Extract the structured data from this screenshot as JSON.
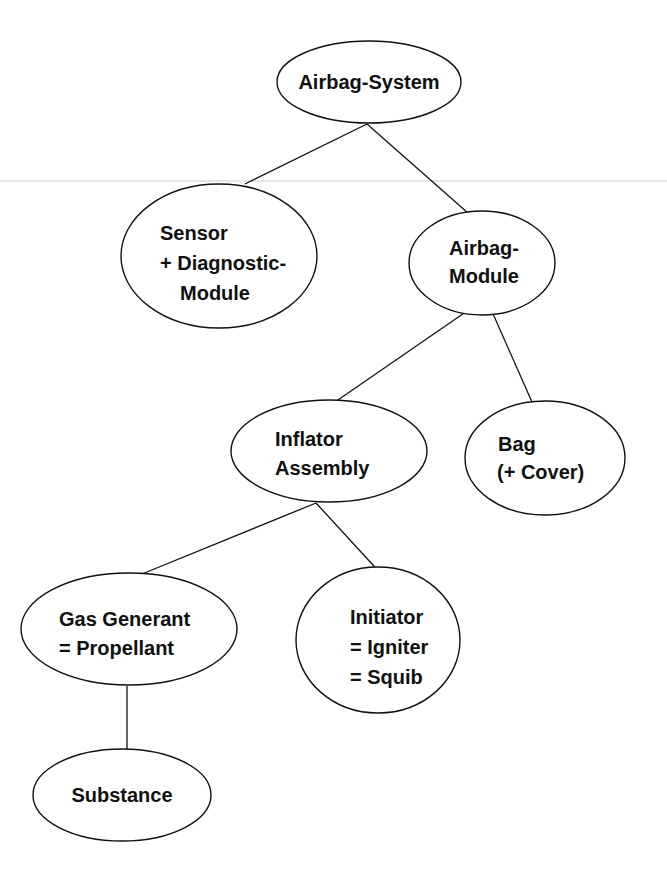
{
  "diagram": {
    "type": "tree",
    "background": "#ffffff",
    "stroke_color": "#111111",
    "nodes": [
      {
        "id": "airbag-system",
        "lines": [
          "Airbag-System"
        ]
      },
      {
        "id": "sensor-diagnostic-module",
        "lines": [
          "Sensor",
          "+ Diagnostic-",
          "Module"
        ]
      },
      {
        "id": "airbag-module",
        "lines": [
          "Airbag-",
          "Module"
        ]
      },
      {
        "id": "inflator-assembly",
        "lines": [
          "Inflator",
          "Assembly"
        ]
      },
      {
        "id": "bag-cover",
        "lines": [
          "Bag",
          "(+ Cover)"
        ]
      },
      {
        "id": "gas-generant",
        "lines": [
          "Gas Generant",
          "= Propellant"
        ]
      },
      {
        "id": "initiator",
        "lines": [
          "Initiator",
          "= Igniter",
          "= Squib"
        ]
      },
      {
        "id": "substance",
        "lines": [
          "Substance"
        ]
      }
    ],
    "edges": [
      {
        "from": "airbag-system",
        "to": "sensor-diagnostic-module"
      },
      {
        "from": "airbag-system",
        "to": "airbag-module"
      },
      {
        "from": "airbag-module",
        "to": "inflator-assembly"
      },
      {
        "from": "airbag-module",
        "to": "bag-cover"
      },
      {
        "from": "inflator-assembly",
        "to": "gas-generant"
      },
      {
        "from": "inflator-assembly",
        "to": "initiator"
      },
      {
        "from": "gas-generant",
        "to": "substance"
      }
    ]
  }
}
